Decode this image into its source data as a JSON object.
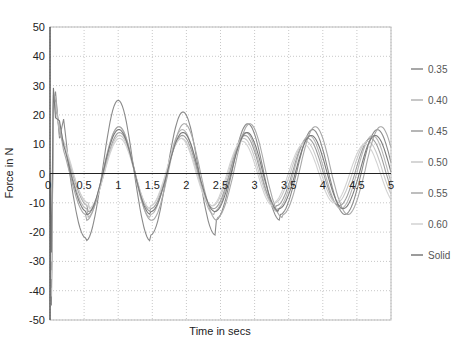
{
  "chart_data": {
    "type": "line",
    "title": "",
    "xlabel": "Time in secs",
    "ylabel": "Force in N",
    "xlim": [
      0,
      5
    ],
    "ylim": [
      -50,
      50
    ],
    "x_ticks": [
      "0",
      "0.5",
      "1",
      "1.5",
      "2",
      "2.5",
      "3",
      "3.5",
      "4",
      "4.5",
      "5"
    ],
    "y_ticks": [
      "50",
      "40",
      "30",
      "20",
      "10",
      "0",
      "-10",
      "-20",
      "-30",
      "-40",
      "-50"
    ],
    "grid": true,
    "legend_position": "right",
    "series": [
      {
        "name": "0.35",
        "color": "#8a8a8a",
        "amp": [
          34,
          25,
          21,
          17,
          15
        ],
        "trough": [
          -22,
          -23,
          -21,
          -16,
          -14
        ],
        "period": 0.95,
        "phase": 0.0
      },
      {
        "name": "0.40",
        "color": "#b5b5b5",
        "amp": [
          16,
          16,
          15,
          14,
          13
        ],
        "trough": [
          -12,
          -15,
          -14,
          -13,
          -12
        ],
        "period": 0.93,
        "phase": 0.03
      },
      {
        "name": "0.45",
        "color": "#9e9e9e",
        "amp": [
          13,
          14,
          13,
          13,
          12
        ],
        "trough": [
          -11,
          -13,
          -12,
          -12,
          -11
        ],
        "period": 0.92,
        "phase": 0.05
      },
      {
        "name": "0.50",
        "color": "#c8c8c8",
        "amp": [
          12,
          13,
          12,
          12,
          11
        ],
        "trough": [
          -10,
          -12,
          -11,
          -11,
          -10
        ],
        "period": 0.91,
        "phase": 0.06
      },
      {
        "name": "0.55",
        "color": "#a8a8a8",
        "amp": [
          14,
          16,
          17,
          17,
          16
        ],
        "trough": [
          -14,
          -16,
          -16,
          -15,
          -14
        ],
        "period": 0.96,
        "phase": 0.0
      },
      {
        "name": "0.60",
        "color": "#d2d2d2",
        "amp": [
          12,
          12,
          12,
          11,
          10
        ],
        "trough": [
          -11,
          -12,
          -11,
          -11,
          -10
        ],
        "period": 0.9,
        "phase": 0.07
      },
      {
        "name": "Solid",
        "color": "#7a7a7a",
        "amp": [
          15,
          15,
          14,
          14,
          13
        ],
        "trough": [
          -13,
          -14,
          -13,
          -13,
          -12
        ],
        "period": 0.94,
        "phase": 0.02
      }
    ]
  }
}
